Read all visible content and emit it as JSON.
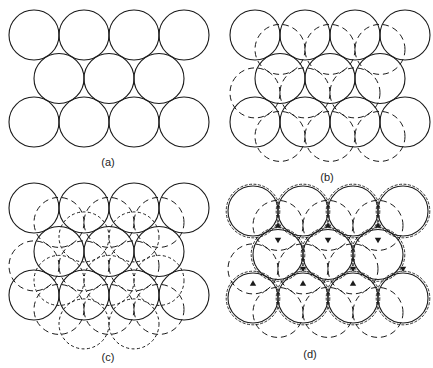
{
  "figure": {
    "radius": 25,
    "colors": {
      "stroke": "#1a1a1a",
      "background": "#ffffff"
    },
    "panels": [
      {
        "id": "a",
        "label": "(a)",
        "label_pos": [
          108,
          166
        ],
        "origin": [
          34,
          35
        ],
        "layers": [
          "A"
        ]
      },
      {
        "id": "b",
        "label": "(b)",
        "label_pos": [
          327,
          181
        ],
        "origin": [
          255,
          35
        ],
        "layers": [
          "A",
          "B"
        ]
      },
      {
        "id": "c",
        "label": "(c)",
        "label_pos": [
          108,
          361
        ],
        "origin": [
          34,
          208
        ],
        "layers": [
          "A",
          "B",
          "C"
        ]
      },
      {
        "id": "d",
        "label": "(d)",
        "label_pos": [
          310,
          358
        ],
        "origin": [
          253,
          211
        ],
        "layers": [
          "A",
          "B",
          "rings",
          "interstitials"
        ]
      }
    ],
    "lattice": {
      "spacing_x": 50,
      "row_dy": 43.5,
      "rows": [
        {
          "count": 4,
          "offset_x": 0
        },
        {
          "count": 3,
          "offset_x": 25
        },
        {
          "count": 4,
          "offset_x": 0
        }
      ],
      "B_shift": [
        25,
        14.4
      ],
      "C_shift": [
        50,
        28.9
      ]
    },
    "legend": {
      "A": "solid outline – first layer",
      "B": "long-dash outline – second layer",
      "C": "short-dash outline – third layer"
    }
  }
}
